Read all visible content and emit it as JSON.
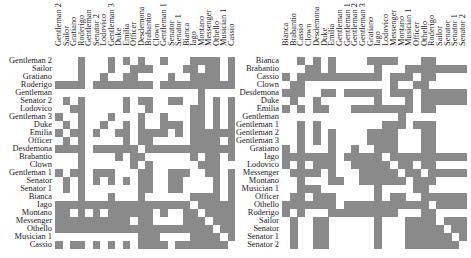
{
  "chart_data": [
    {
      "type": "heatmap",
      "title": "",
      "subtitle": "Adjacency matrix (clustered order)",
      "grid": false,
      "colors": {
        "on": "#8a8a8a",
        "off": "#ffffff"
      },
      "columns": [
        "Gentleman 2",
        "Sailor",
        "Gratiano",
        "Roderigo",
        "Gentleman",
        "Senator 2",
        "Lodovico",
        "Gentleman 3",
        "Duke",
        "Emilia",
        "Officer",
        "Desdemona",
        "Brabantio",
        "Clown",
        "Gentleman 1",
        "Senator",
        "Senator 1",
        "Bianca",
        "Iago",
        "Montano",
        "Messenger",
        "Othello",
        "Musician 1",
        "Cassio"
      ],
      "rows": [
        "Gentleman 2",
        "Sailor",
        "Gratiano",
        "Roderigo",
        "Gentleman",
        "Senator 2",
        "Lodovico",
        "Gentleman 3",
        "Duke",
        "Emilia",
        "Officer",
        "Desdemona",
        "Brabantio",
        "Clown",
        "Gentleman 1",
        "Senator",
        "Senator 1",
        "Bianca",
        "Iago",
        "Montano",
        "Messenger",
        "Othello",
        "Musician 1",
        "Cassio"
      ],
      "matrix": [
        "000100010101001000111101",
        "000100010011100001101101",
        "000100100110000100111101",
        "111101111111101111111111",
        "000000000000000000010000",
        "010100000101100110010101",
        "001100000100100000110101",
        "100100010001001000110101",
        "010100100101001110110101",
        "101101001101111010111111",
        "010100000101100000111101",
        "111101111110111111111111",
        "000100001011000000101101",
        "000100000010100000011100",
        "101101110001100111001101",
        "010101010101100110000101",
        "010100000001100110000101",
        "000100010001000000111101",
        "111111111111111111011111",
        "110101011111101001101111",
        "111111111101100001110111",
        "111111111111111111111011",
        "000000000001110000111101",
        "101101010101111011111110"
      ]
    },
    {
      "type": "heatmap",
      "title": "",
      "subtitle": "Adjacency matrix (alphabetical order)",
      "grid": false,
      "colors": {
        "on": "#8a8a8a",
        "off": "#ffffff"
      },
      "columns": [
        "Bianca",
        "Brabantio",
        "Cassio",
        "Clown",
        "Desdemona",
        "Duke",
        "Emilia",
        "Gentleman",
        "Gentleman 1",
        "Gentleman 2",
        "Gentleman 3",
        "Gratiano",
        "Iago",
        "Lodovico",
        "Messenger",
        "Montano",
        "Musician 1",
        "Officer",
        "Othello",
        "Roderigo",
        "Sailor",
        "Senator",
        "Senator 1",
        "Senator 2"
      ],
      "rows": [
        "Bianca",
        "Brabantio",
        "Cassio",
        "Clown",
        "Desdemona",
        "Duke",
        "Emilia",
        "Gentleman",
        "Gentleman 1",
        "Gentleman 2",
        "Gentleman 3",
        "Gratiano",
        "Iago",
        "Lodovico",
        "Messenger",
        "Montano",
        "Musician 1",
        "Officer",
        "Othello",
        "Roderigo",
        "Sailor",
        "Senator",
        "Senator 1",
        "Senator 2"
      ],
      "matrix": [
        "001010100001111000110000",
        "000110100000100011111111",
        "101111111111101110110000",
        "011000000000001001100000",
        "111001101111101110111111",
        "010010000000100010111111",
        "101011000111111110110000",
        "000000000000000100000000",
        "001010000000011101110000",
        "001010100001111000110000",
        "001010100001111000110000",
        "101000100100111000110000",
        "111111101111101111111111",
        "101011100111110110110000",
        "011110100011111011011111",
        "001000110011111101110000",
        "001110000000100001100000",
        "011011100000101100111111",
        "111111101111111111101111",
        "101000111111111000110000",
        "010011000000100011110111",
        "010011000000100011111011",
        "010011000000100011111101",
        "010011000000100011111110"
      ]
    }
  ]
}
